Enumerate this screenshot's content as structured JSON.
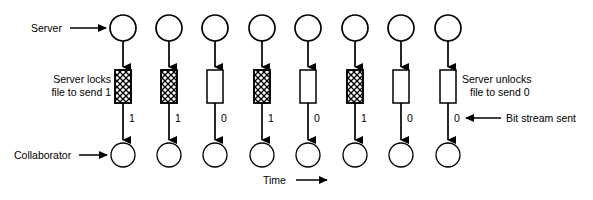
{
  "figure": {
    "type": "timing-sequence-diagram",
    "background_color": "#ffffff",
    "line_color": "#000000"
  },
  "labels": {
    "server": "Server",
    "collaborator": "Collaborator",
    "server_locks_line1": "Server locks",
    "server_locks_line2": "file to send 1",
    "server_unlocks_line1": "Server unlocks",
    "server_unlocks_line2": "file to send 0",
    "bit_stream_sent": "Bit stream sent",
    "time": "Time"
  },
  "columns": [
    {
      "index": 0,
      "cx": 123,
      "bit": "1",
      "locked": true
    },
    {
      "index": 1,
      "cx": 169,
      "bit": "1",
      "locked": true
    },
    {
      "index": 2,
      "cx": 215,
      "bit": "0",
      "locked": false
    },
    {
      "index": 3,
      "cx": 262,
      "bit": "1",
      "locked": true
    },
    {
      "index": 4,
      "cx": 308,
      "bit": "0",
      "locked": false
    },
    {
      "index": 5,
      "cx": 355,
      "bit": "1",
      "locked": true
    },
    {
      "index": 6,
      "cx": 401,
      "bit": "0",
      "locked": false
    },
    {
      "index": 7,
      "cx": 448,
      "bit": "0",
      "locked": false
    }
  ],
  "bit_stream": "1 1 0 1 0 1 0 0",
  "geometry": {
    "top_circle_cy": 28,
    "top_circle_r": 13,
    "bottom_circle_cy": 155,
    "bottom_circle_r": 12,
    "rect_top": 70,
    "rect_height": 33,
    "rect_width": 16
  }
}
